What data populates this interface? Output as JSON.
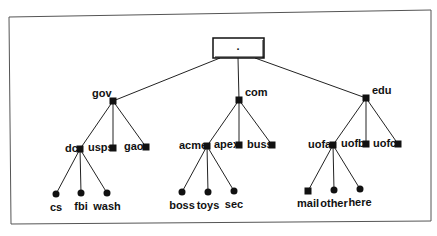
{
  "diagram": {
    "type": "tree",
    "root": {
      "label": "."
    },
    "colors": {
      "line": "#222222",
      "node": "#111111",
      "frame": "#555555",
      "background": "#ffffff"
    },
    "nodes": [
      {
        "id": "gov",
        "label": "gov",
        "shape": "square",
        "parent": "root",
        "x": 113,
        "y": 101,
        "lx": -21,
        "ly": -4,
        "anchor": "start"
      },
      {
        "id": "com",
        "label": "com",
        "shape": "square",
        "parent": "root",
        "x": 239,
        "y": 100,
        "lx": 6,
        "ly": -4,
        "anchor": "start"
      },
      {
        "id": "edu",
        "label": "edu",
        "shape": "square",
        "parent": "root",
        "x": 366,
        "y": 98,
        "lx": 6,
        "ly": -4,
        "anchor": "start"
      },
      {
        "id": "dc",
        "label": "dc",
        "shape": "square",
        "parent": "gov",
        "x": 80,
        "y": 149,
        "lx": -15,
        "ly": 3,
        "anchor": "start"
      },
      {
        "id": "usps",
        "label": "usps",
        "shape": "square",
        "parent": "gov",
        "x": 113,
        "y": 148,
        "lx": -25,
        "ly": 3,
        "anchor": "start"
      },
      {
        "id": "gao",
        "label": "gao",
        "shape": "square",
        "parent": "gov",
        "x": 146,
        "y": 147,
        "lx": -22,
        "ly": 3,
        "anchor": "start"
      },
      {
        "id": "acme",
        "label": "acme",
        "shape": "square",
        "parent": "com",
        "x": 207,
        "y": 146,
        "lx": -28,
        "ly": 3,
        "anchor": "start"
      },
      {
        "id": "apex",
        "label": "apex",
        "shape": "square",
        "parent": "com",
        "x": 239,
        "y": 145,
        "lx": -25,
        "ly": 3,
        "anchor": "start"
      },
      {
        "id": "buss",
        "label": "buss",
        "shape": "square",
        "parent": "com",
        "x": 272,
        "y": 145,
        "lx": -25,
        "ly": 3,
        "anchor": "start"
      },
      {
        "id": "uofa",
        "label": "uofa",
        "shape": "square",
        "parent": "edu",
        "x": 333,
        "y": 145,
        "lx": -25,
        "ly": 3,
        "anchor": "start"
      },
      {
        "id": "uofb",
        "label": "uofb",
        "shape": "square",
        "parent": "edu",
        "x": 366,
        "y": 144,
        "lx": -25,
        "ly": 3,
        "anchor": "start"
      },
      {
        "id": "uofc",
        "label": "uofc",
        "shape": "square",
        "parent": "edu",
        "x": 398,
        "y": 144,
        "lx": -25,
        "ly": 3,
        "anchor": "start"
      },
      {
        "id": "cs",
        "label": "cs",
        "shape": "circle",
        "parent": "dc",
        "x": 56,
        "y": 194,
        "lx": 0,
        "ly": 17,
        "anchor": "middle"
      },
      {
        "id": "fbi",
        "label": "fbi",
        "shape": "circle",
        "parent": "dc",
        "x": 81,
        "y": 193,
        "lx": 0,
        "ly": 17,
        "anchor": "middle"
      },
      {
        "id": "wash",
        "label": "wash",
        "shape": "circle",
        "parent": "dc",
        "x": 107,
        "y": 193,
        "lx": 0,
        "ly": 17,
        "anchor": "middle"
      },
      {
        "id": "boss",
        "label": "boss",
        "shape": "circle",
        "parent": "acme",
        "x": 182,
        "y": 192,
        "lx": 0,
        "ly": 17,
        "anchor": "middle"
      },
      {
        "id": "toys",
        "label": "toys",
        "shape": "circle",
        "parent": "acme",
        "x": 208,
        "y": 192,
        "lx": 0,
        "ly": 17,
        "anchor": "middle"
      },
      {
        "id": "sec",
        "label": "sec",
        "shape": "circle",
        "parent": "acme",
        "x": 234,
        "y": 191,
        "lx": 0,
        "ly": 17,
        "anchor": "middle"
      },
      {
        "id": "mail",
        "label": "mail",
        "shape": "square",
        "parent": "uofa",
        "x": 308,
        "y": 191,
        "lx": 0,
        "ly": 16,
        "anchor": "middle"
      },
      {
        "id": "other",
        "label": "other",
        "shape": "circle",
        "parent": "uofa",
        "x": 334,
        "y": 190,
        "lx": 0,
        "ly": 17,
        "anchor": "middle"
      },
      {
        "id": "here",
        "label": "here",
        "shape": "circle",
        "parent": "uofa",
        "x": 360,
        "y": 189,
        "lx": 0,
        "ly": 17,
        "anchor": "middle"
      }
    ]
  }
}
